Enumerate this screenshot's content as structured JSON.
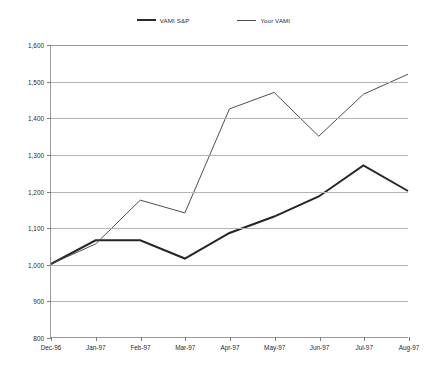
{
  "legend": {
    "items": [
      {
        "label": "VAMI S&P",
        "style": "s1",
        "color": "#262626"
      },
      {
        "label": "Your VAMI",
        "style": "s2",
        "color": "#4d4d4d"
      }
    ]
  },
  "chart_data": {
    "type": "line",
    "title": "",
    "xlabel": "",
    "ylabel": "",
    "categories": [
      "Dec-96",
      "Jan-97",
      "Feb-97",
      "Mar-97",
      "Apr-97",
      "May-97",
      "Jun-97",
      "Jul-97",
      "Aug-97"
    ],
    "ylim": [
      800,
      1600
    ],
    "ytick_step": 100,
    "ytick_labels": [
      "1,600",
      "1,500",
      "1,400",
      "1,300",
      "1,200",
      "1,100",
      "1,000",
      "900",
      "800"
    ],
    "ytick_values": [
      1600,
      1500,
      1400,
      1300,
      1200,
      1100,
      1000,
      900,
      800
    ],
    "grid": true,
    "legend_position": "top-center",
    "series": [
      {
        "name": "VAMI S&P",
        "color": "#262626",
        "values": [
          1000,
          1065,
          1065,
          1015,
          1085,
          1130,
          1185,
          1270,
          1200
        ]
      },
      {
        "name": "Your VAMI",
        "color": "#4d4d4d",
        "values": [
          1000,
          1055,
          1175,
          1140,
          1425,
          1470,
          1350,
          1465,
          1520
        ]
      }
    ]
  }
}
